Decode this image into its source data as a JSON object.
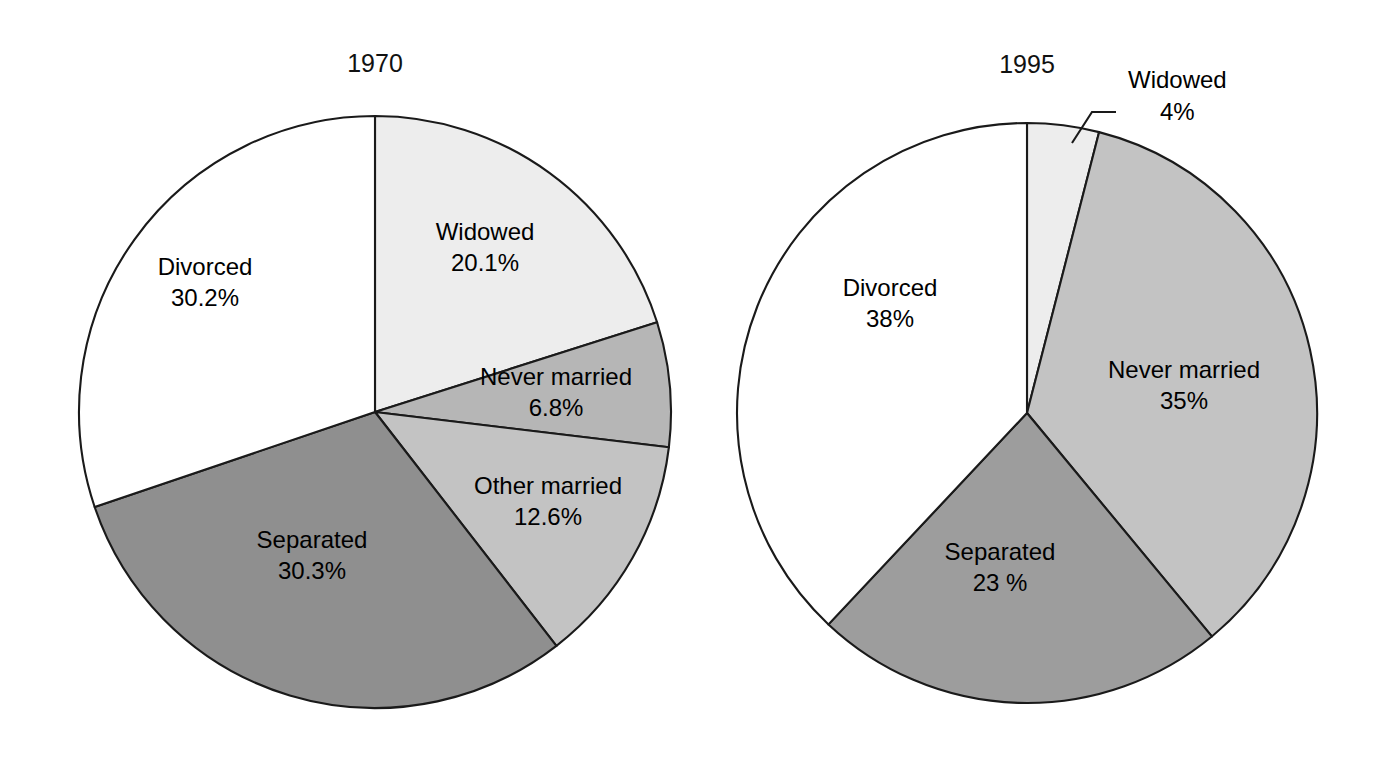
{
  "figure": {
    "background_color": "#ffffff",
    "outline_color": "#1a1a1a",
    "text_color": "#000000"
  },
  "chart_data": [
    {
      "type": "pie",
      "title": "1970",
      "center": [
        375,
        412
      ],
      "radius": 296,
      "start_angle_deg": 0,
      "direction": "clockwise",
      "total": 100.0,
      "categories": [
        "Widowed",
        "Never married",
        "Other married",
        "Separated",
        "Divorced"
      ],
      "values": [
        20.1,
        6.8,
        12.6,
        30.3,
        30.2
      ],
      "value_labels": [
        "20.1%",
        "6.8%",
        "12.6%",
        "30.3%",
        "30.2%"
      ],
      "colors": [
        "#ededed",
        "#b6b6b6",
        "#c3c3c3",
        "#8f8f8f",
        "#ffffff"
      ],
      "label_positions": [
        [
          485,
          240
        ],
        [
          556,
          385
        ],
        [
          548,
          494
        ],
        [
          312,
          548
        ],
        [
          205,
          275
        ]
      ],
      "legend": "none",
      "grid": false
    },
    {
      "type": "pie",
      "title": "1995",
      "center": [
        1027,
        413
      ],
      "radius": 290,
      "start_angle_deg": 0,
      "direction": "clockwise",
      "total": 100.0,
      "categories": [
        "Widowed",
        "Never married",
        "Separated",
        "Divorced"
      ],
      "values": [
        4,
        35,
        23,
        38
      ],
      "value_labels": [
        "4%",
        "35%",
        "23 %",
        "38%"
      ],
      "colors": [
        "#ededed",
        "#c3c3c3",
        "#9d9d9d",
        "#ffffff"
      ],
      "label_positions": [
        [
          null,
          null
        ],
        [
          1184,
          378
        ],
        [
          1000,
          560
        ],
        [
          890,
          296
        ]
      ],
      "callout": {
        "category": "Widowed",
        "label": "Widowed",
        "value_label": "4%",
        "label_x": 1128,
        "label_y": 88,
        "value_x": 1160,
        "value_y": 120,
        "leader_points": "1072,143 1092,112 1116,112"
      },
      "legend": "none",
      "grid": false
    }
  ]
}
